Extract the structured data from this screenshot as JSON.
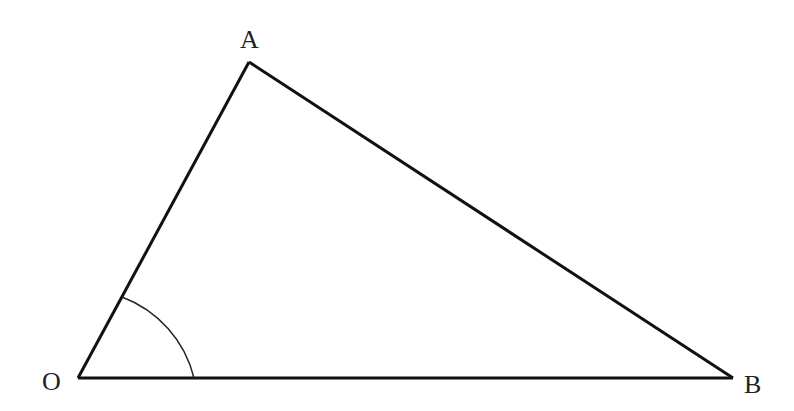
{
  "diagram": {
    "type": "triangle",
    "vertices": {
      "O": {
        "label": "O",
        "x": 78,
        "y": 378
      },
      "A": {
        "label": "A",
        "x": 249,
        "y": 62
      },
      "B": {
        "label": "B",
        "x": 733,
        "y": 378
      }
    },
    "angle_marker": {
      "at": "O",
      "between": [
        "A",
        "B"
      ],
      "radius": 116
    },
    "colors": {
      "stroke": "#111111",
      "label": "#222222",
      "background": "#ffffff"
    }
  }
}
